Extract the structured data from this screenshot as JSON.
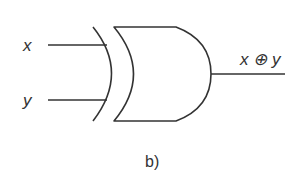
{
  "diagram": {
    "type": "logic-gate",
    "gate": "XOR",
    "inputs": [
      {
        "label": "x"
      },
      {
        "label": "y"
      }
    ],
    "output": {
      "label": "x ⊕ y"
    },
    "caption": "b)",
    "colors": {
      "stroke": "#333333",
      "background": "#ffffff"
    }
  }
}
